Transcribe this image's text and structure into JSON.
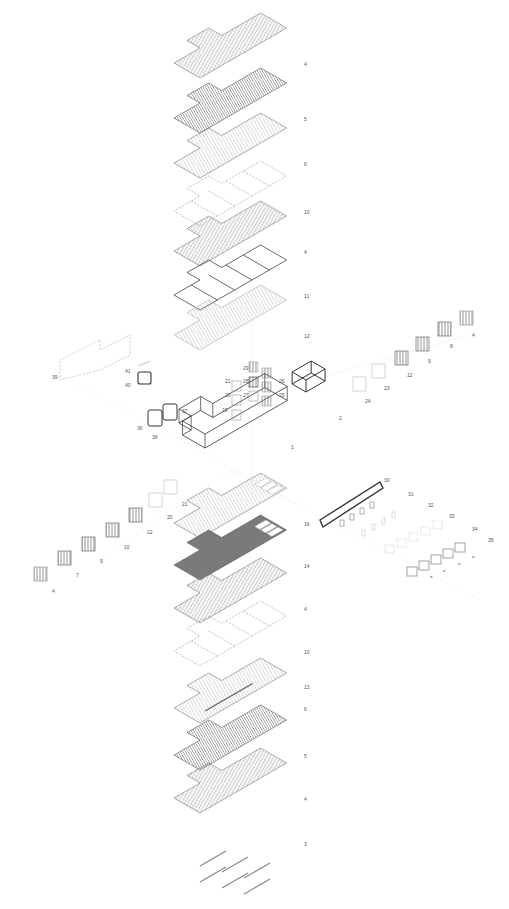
{
  "diagram": {
    "type": "exploded axonometric",
    "background": "#ffffff",
    "line_color": "#555555",
    "hatch_light": "#9a9a9a",
    "hatch_dark": "#5a5a5a"
  },
  "vertical_stack_upper": [
    {
      "id": "u1",
      "label": "4",
      "style": "hatch",
      "y": 60
    },
    {
      "id": "u2",
      "label": "5",
      "style": "dark-slats",
      "y": 115
    },
    {
      "id": "u3",
      "label": "6",
      "style": "slats",
      "y": 160
    },
    {
      "id": "u4",
      "label": "10",
      "style": "frame",
      "y": 208
    },
    {
      "id": "u5",
      "label": "4",
      "style": "hatch",
      "y": 248
    },
    {
      "id": "u6",
      "label": "11",
      "style": "panels",
      "y": 292
    },
    {
      "id": "u7",
      "label": "12",
      "style": "light-slats",
      "y": 332
    }
  ],
  "center_parts": [
    {
      "label": "29",
      "x": 243,
      "y": 366
    },
    {
      "label": "21",
      "x": 225,
      "y": 379
    },
    {
      "label": "28",
      "x": 243,
      "y": 379
    },
    {
      "label": "26",
      "x": 279,
      "y": 379
    },
    {
      "label": "20",
      "x": 225,
      "y": 393
    },
    {
      "label": "27",
      "x": 243,
      "y": 393
    },
    {
      "label": "25",
      "x": 279,
      "y": 393
    },
    {
      "label": "19",
      "x": 222,
      "y": 408
    },
    {
      "label": "1",
      "x": 291,
      "y": 445
    },
    {
      "label": "2",
      "x": 339,
      "y": 416
    }
  ],
  "left_cluster": [
    {
      "label": "39",
      "x": 52,
      "y": 375
    },
    {
      "label": "41",
      "x": 125,
      "y": 369
    },
    {
      "label": "40",
      "x": 125,
      "y": 383
    },
    {
      "label": "37",
      "x": 182,
      "y": 409
    },
    {
      "label": "36",
      "x": 137,
      "y": 426
    },
    {
      "label": "38",
      "x": 152,
      "y": 435
    }
  ],
  "right_facade_stack": [
    {
      "label": "4",
      "x": 472,
      "y": 333
    },
    {
      "label": "8",
      "x": 450,
      "y": 344
    },
    {
      "label": "9",
      "x": 428,
      "y": 359
    },
    {
      "label": "12",
      "x": 407,
      "y": 373
    },
    {
      "label": "23",
      "x": 384,
      "y": 386
    },
    {
      "label": "24",
      "x": 365,
      "y": 399
    }
  ],
  "left_facade_stack": [
    {
      "label": "21",
      "x": 182,
      "y": 502
    },
    {
      "label": "20",
      "x": 167,
      "y": 515
    },
    {
      "label": "22",
      "x": 147,
      "y": 530
    },
    {
      "label": "10",
      "x": 124,
      "y": 545
    },
    {
      "label": "9",
      "x": 100,
      "y": 559
    },
    {
      "label": "7",
      "x": 76,
      "y": 573
    },
    {
      "label": "4",
      "x": 52,
      "y": 589
    }
  ],
  "right_component_stack": [
    {
      "label": "30",
      "x": 384,
      "y": 478
    },
    {
      "label": "31",
      "x": 408,
      "y": 492
    },
    {
      "label": "32",
      "x": 428,
      "y": 503
    },
    {
      "label": "33",
      "x": 449,
      "y": 514
    },
    {
      "label": "34",
      "x": 472,
      "y": 527
    },
    {
      "label": "35",
      "x": 488,
      "y": 538
    }
  ],
  "vertical_stack_lower": [
    {
      "id": "l1",
      "label": "16",
      "style": "slats-openings",
      "y": 520
    },
    {
      "id": "l2",
      "label": "14",
      "style": "dark-fill",
      "y": 562
    },
    {
      "id": "l3",
      "label": "4",
      "style": "hatch",
      "y": 605
    },
    {
      "id": "l4",
      "label": "10",
      "style": "frame",
      "y": 648
    },
    {
      "id": "l5",
      "label": "13",
      "style": "beam",
      "y": 683
    },
    {
      "id": "l6",
      "label": "6",
      "style": "slats",
      "y": 705
    },
    {
      "id": "l7",
      "label": "5",
      "style": "dark-slats",
      "y": 752
    },
    {
      "id": "l8",
      "label": "4",
      "style": "hatch",
      "y": 795
    },
    {
      "id": "l9",
      "label": "3",
      "style": "beams",
      "y": 840
    }
  ]
}
